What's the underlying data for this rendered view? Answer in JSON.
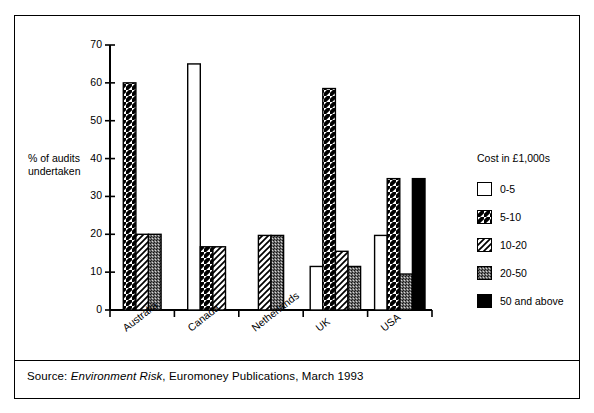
{
  "chart_data": {
    "type": "bar",
    "title": "",
    "subtitle": "",
    "xlabel": "",
    "ylabel": "% of audits undertaken",
    "ylim": [
      0,
      70
    ],
    "yticks": [
      0,
      10,
      20,
      30,
      40,
      50,
      60,
      70
    ],
    "ytick_labels": [
      "0",
      "10",
      "20",
      "30",
      "40",
      "50",
      "60",
      "70"
    ],
    "grid": false,
    "legend_position": "right",
    "legend_title": "Cost in £1,000s",
    "categories": [
      "Australia",
      "Canada",
      "Netherlands",
      "UK",
      "USA"
    ],
    "series": [
      {
        "name": "0-5",
        "pattern": "solid-white",
        "values": [
          0,
          65,
          0,
          11.5,
          19.7
        ]
      },
      {
        "name": "5-10",
        "pattern": "hatch-fwd",
        "values": [
          60,
          16.7,
          0,
          58.5,
          34.7
        ]
      },
      {
        "name": "10-20",
        "pattern": "hatch-back",
        "values": [
          20,
          16.7,
          19.7,
          15.5,
          0
        ]
      },
      {
        "name": "20-50",
        "pattern": "stipple",
        "values": [
          20,
          0,
          19.7,
          11.5,
          9.5
        ]
      },
      {
        "name": "50 and above",
        "pattern": "solid-black",
        "values": [
          0,
          0,
          0,
          0,
          34.7
        ]
      }
    ],
    "netherlands_note": "",
    "source": {
      "prefix": "Source: ",
      "italic": "Environment Risk",
      "suffix": ", Euromoney Publications, March 1993"
    }
  },
  "legend": {
    "title": "Cost in £1,000s",
    "items": [
      {
        "label": "0-5",
        "pattern": "solid-white"
      },
      {
        "label": "5-10",
        "pattern": "hatch-fwd"
      },
      {
        "label": "10-20",
        "pattern": "hatch-back"
      },
      {
        "label": "20-50",
        "pattern": "stipple"
      },
      {
        "label": "50 and above",
        "pattern": "solid-black"
      }
    ]
  },
  "axes": {
    "y_label_line1": "% of audits",
    "y_label_line2": "undertaken"
  },
  "colors": {
    "ink": "#000000",
    "paper": "#ffffff",
    "stipple": "#8a8a8a"
  }
}
